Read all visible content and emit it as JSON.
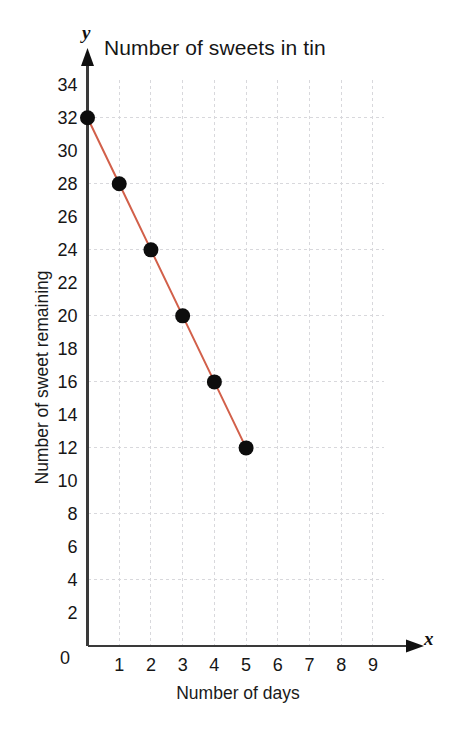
{
  "chart_data": {
    "type": "line",
    "title": "Number of sweets in tin",
    "xlabel": "Number of days",
    "ylabel": "Number of sweet remaining",
    "x_axis_letter": "y",
    "y_axis_letter": "x",
    "x": [
      0,
      1,
      2,
      3,
      4,
      5
    ],
    "values": [
      32,
      28,
      24,
      20,
      16,
      12
    ],
    "series": [
      {
        "name": "Sweets remaining",
        "x": [
          0,
          1,
          2,
          3,
          4,
          5
        ],
        "values": [
          32,
          28,
          24,
          20,
          16,
          12
        ]
      }
    ],
    "points": [
      {
        "x": 0,
        "y": 32
      },
      {
        "x": 1,
        "y": 28
      },
      {
        "x": 2,
        "y": 24
      },
      {
        "x": 3,
        "y": 20
      },
      {
        "x": 4,
        "y": 16
      },
      {
        "x": 5,
        "y": 12
      }
    ],
    "xlim": [
      0,
      9.6
    ],
    "ylim": [
      0,
      35.5
    ],
    "x_ticks": [
      0,
      1,
      2,
      3,
      4,
      5,
      6,
      7,
      8,
      9
    ],
    "x_tick_labels": [
      "0",
      "1",
      "2",
      "3",
      "4",
      "5",
      "6",
      "7",
      "8",
      "9"
    ],
    "y_ticks": [
      0,
      2,
      4,
      6,
      8,
      10,
      12,
      14,
      16,
      18,
      20,
      22,
      24,
      26,
      28,
      30,
      32,
      34
    ],
    "y_tick_labels": [
      "0",
      "2",
      "4",
      "6",
      "8",
      "10",
      "12",
      "14",
      "16",
      "18",
      "20",
      "22",
      "24",
      "26",
      "28",
      "30",
      "32",
      "34"
    ],
    "grid": true,
    "grid_style": "dashed",
    "grid_x_step": 1,
    "grid_y_step": 4,
    "legend": false,
    "legend_position": "none",
    "line_color": "#d2604a",
    "marker_color": "#0d0d0d",
    "marker_shape": "circle",
    "axis_color": "#3a3a3a",
    "grid_color": "#d8d8dc",
    "background_color": "#ffffff",
    "x_axis_arrow": true,
    "y_axis_arrow": true
  },
  "chart": {
    "title": "Number of sweets in tin",
    "y_axis_title": "Number of sweet remaining",
    "x_axis_title": "Number of days",
    "y_letter": "y",
    "x_letter": "x",
    "origin_label": "0"
  }
}
